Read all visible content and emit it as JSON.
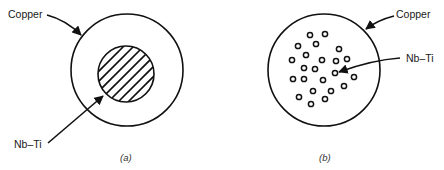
{
  "figure": {
    "panels": [
      {
        "id": "a",
        "caption": "(a)",
        "description": "Monofilament conductor: single Nb–Ti core in copper matrix",
        "labels": {
          "outer": "Copper",
          "core": "Nb–Ti"
        },
        "outer_circle": {
          "cx": 127,
          "cy": 70,
          "r": 56
        },
        "core_circle": {
          "cx": 126,
          "cy": 74,
          "r": 28,
          "fill": "hatched"
        }
      },
      {
        "id": "b",
        "caption": "(b)",
        "description": "Multifilament conductor: many Nb–Ti filaments in copper matrix",
        "labels": {
          "outer": "Copper",
          "core": "Nb–Ti"
        },
        "outer_circle": {
          "cx": 324,
          "cy": 70,
          "r": 56
        },
        "filament_count": 23
      }
    ]
  },
  "colors": {
    "line": "#111111",
    "text": "#1a1a1a",
    "background": "#ffffff"
  }
}
